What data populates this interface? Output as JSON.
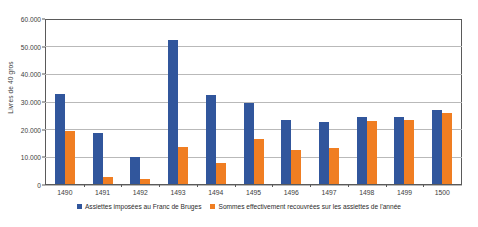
{
  "chart_data": {
    "type": "bar",
    "title": "",
    "xlabel": "",
    "ylabel": "Livres de 40 gros",
    "ylim": [
      0,
      60000
    ],
    "yticks": [
      "0",
      "10.000",
      "20.000",
      "30.000",
      "40.000",
      "50.000",
      "60.000"
    ],
    "ytick_values": [
      0,
      10000,
      20000,
      30000,
      40000,
      50000,
      60000
    ],
    "grid": true,
    "legend_position": "bottom",
    "categories": [
      "1490",
      "1491",
      "1492",
      "1493",
      "1494",
      "1495",
      "1496",
      "1497",
      "1498",
      "1499",
      "1500"
    ],
    "series": [
      {
        "name": "Assiettes imposées au Franc de Bruges",
        "color": "#31569c",
        "values": [
          32700,
          18400,
          10000,
          52300,
          32300,
          29300,
          23400,
          22500,
          24500,
          24200,
          26800
        ]
      },
      {
        "name": "Sommes effectivement recouvrées sur les assiettes de l'année",
        "color": "#f07e22",
        "values": [
          19300,
          2400,
          1800,
          13300,
          7700,
          16300,
          12400,
          13000,
          23000,
          23300,
          25800
        ]
      }
    ]
  },
  "top_caption": "",
  "colors": {
    "series_a": "#31569c",
    "series_b": "#f07e22",
    "axis": "#5a5a5a",
    "gridline": "#b9b9b9",
    "text": "#2b2b2b",
    "background": "#ffffff"
  }
}
